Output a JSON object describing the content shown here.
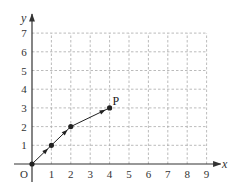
{
  "chart_data": {
    "type": "line",
    "title": "",
    "xlabel": "x",
    "ylabel": "y",
    "origin_label": "O",
    "xlim": [
      0,
      9
    ],
    "ylim": [
      0,
      7
    ],
    "grid": true,
    "grid_style": "dashed",
    "x_ticks": [
      "1",
      "2",
      "3",
      "4",
      "5",
      "6",
      "7",
      "8",
      "9"
    ],
    "y_ticks": [
      "1",
      "2",
      "3",
      "4",
      "5",
      "6",
      "7"
    ],
    "series": [
      {
        "name": "path to P",
        "points": [
          [
            0,
            0
          ],
          [
            1,
            1
          ],
          [
            2,
            2
          ],
          [
            4,
            3
          ]
        ],
        "directed": true
      }
    ],
    "annotations": [
      {
        "label": "P",
        "x": 4,
        "y": 3
      }
    ]
  },
  "colors": {
    "axis": "#333333",
    "grid": "#aaaaaa",
    "path": "#222222"
  }
}
